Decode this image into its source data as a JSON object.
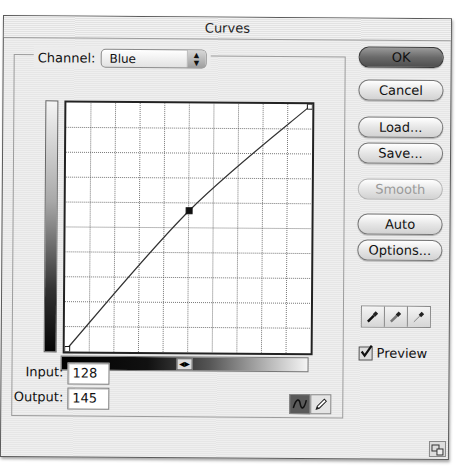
{
  "window": {
    "title": "Curves"
  },
  "channel": {
    "label": "Channel:",
    "selected": "Blue"
  },
  "curve_editor": {
    "grid_divisions": 10,
    "input_range": [
      0,
      255
    ],
    "output_range": [
      0,
      255
    ],
    "points": [
      [
        0,
        0
      ],
      [
        128,
        145
      ],
      [
        255,
        255
      ]
    ],
    "selected_point": [
      128,
      145
    ]
  },
  "fields": {
    "input": {
      "label": "Input:",
      "value": "128"
    },
    "output": {
      "label": "Output:",
      "value": "145"
    }
  },
  "buttons": {
    "ok": "OK",
    "cancel": "Cancel",
    "load": "Load...",
    "save": "Save...",
    "smooth": "Smooth",
    "auto": "Auto",
    "options": "Options..."
  },
  "eyedroppers": [
    "black-point-eyedropper",
    "gray-point-eyedropper",
    "white-point-eyedropper"
  ],
  "tools": {
    "active": "curve-tool",
    "inactive": "pencil-tool"
  },
  "preview": {
    "label": "Preview",
    "checked": true
  }
}
